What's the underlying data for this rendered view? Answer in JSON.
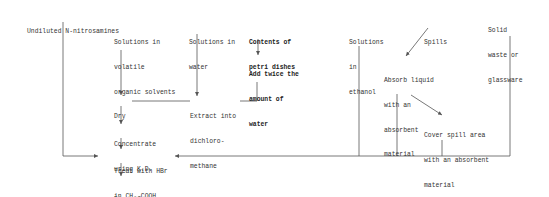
{
  "diagram": {
    "nodes": {
      "undiluted": {
        "lines": [
          "Undiluted N-nitrosamines"
        ]
      },
      "volatile": {
        "lines": [
          "Solutions in",
          "volatile",
          "organic solvents"
        ]
      },
      "water": {
        "lines": [
          "Solutions in",
          "water"
        ]
      },
      "petri": {
        "lines": [
          "Contents of",
          "petri dishes"
        ]
      },
      "add_water": {
        "lines": [
          "Add twice the",
          "amount of",
          "water"
        ]
      },
      "ethanol": {
        "lines": [
          "Solutions",
          "in",
          "ethanol"
        ]
      },
      "spills": {
        "lines": [
          "Spills"
        ]
      },
      "solid": {
        "lines": [
          "Solid",
          "waste or",
          "glassware"
        ]
      },
      "absorb": {
        "lines": [
          "Absorb liquid",
          "with an",
          "absorbent",
          "material"
        ]
      },
      "cover": {
        "lines": [
          "Cover spill area",
          "with an absorbent",
          "material"
        ]
      },
      "dry": {
        "lines": [
          "Dry"
        ]
      },
      "extract": {
        "lines": [
          "Extract into",
          "dichloro-",
          "methane"
        ]
      },
      "concentrate": {
        "lines": [
          "Concentrate",
          "using K.D."
        ]
      },
      "treat": {
        "lines": [
          "Treat with HBr",
          "in CH₃-COOH"
        ]
      },
      "discard": {
        "lines": [
          "Discard"
        ]
      }
    },
    "colors": {
      "line": "#555555",
      "text": "#333333",
      "background": "#ffffff"
    }
  }
}
